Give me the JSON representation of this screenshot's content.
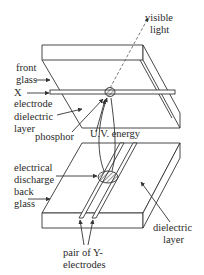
{
  "diagram": {
    "type": "plasma-display-cell-cross-section",
    "colors": {
      "stroke": "#333333",
      "text": "#2a2a2a",
      "background": "#ffffff"
    },
    "top_panel": {
      "labels": {
        "visible_light": [
          "visible",
          "light"
        ],
        "front_glass": [
          "front",
          "glass"
        ],
        "x_electrode": [
          "X",
          "electrode"
        ],
        "dielectric_layer": [
          "dielectric",
          "layer"
        ],
        "phosphor": "phosphor",
        "uv_energy": "U.V. energy"
      }
    },
    "bottom_panel": {
      "labels": {
        "electrical_discharge": [
          "electrical",
          "discharge"
        ],
        "back_glass": [
          "back",
          "glass"
        ],
        "dielectric_layer": [
          "dielectric",
          "layer"
        ],
        "y_electrodes": [
          "pair of Y-",
          "electrodes"
        ]
      }
    }
  }
}
